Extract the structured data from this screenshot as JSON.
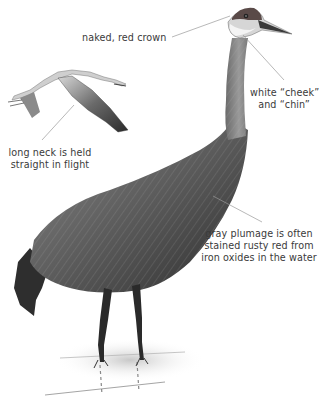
{
  "figure": {
    "background_color": "#ffffff",
    "crown_color": "#5a4a48",
    "plumage_color": "#6e6e6e",
    "leader_line_color": "#9a9a9a",
    "text_color": "#3a3a3a"
  },
  "annotations": [
    {
      "id": "crown",
      "lines": [
        "naked, red crown"
      ]
    },
    {
      "id": "cheek",
      "lines": [
        "white “cheek”",
        "and “chin”"
      ]
    },
    {
      "id": "neck",
      "lines": [
        "long neck is held",
        "straight in flight"
      ]
    },
    {
      "id": "plumage",
      "lines": [
        "gray plumage is often",
        "stained rusty red from",
        "iron oxides in the water"
      ]
    }
  ]
}
